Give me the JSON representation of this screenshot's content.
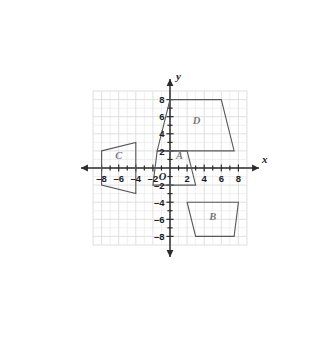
{
  "figure": {
    "background_color": "#ffffff",
    "shape_stroke_color": "#58585c",
    "grid_color": "#e8e8ea",
    "axis_color": "#2b2b2b",
    "label_color": "#7a7a80"
  },
  "axes": {
    "x_axis_name": "x",
    "y_axis_name": "y",
    "origin_label": "O",
    "x_range": [
      -9,
      9
    ],
    "y_range": [
      -9,
      9
    ],
    "grid_step": 1,
    "major_grid_step": 2,
    "x_tick_labels": [
      "–8",
      "–6",
      "–4",
      "–2",
      "2",
      "4",
      "6",
      "8"
    ],
    "x_tick_values": [
      -8,
      -6,
      -4,
      -2,
      2,
      4,
      6,
      8
    ],
    "y_tick_labels": [
      "8",
      "6",
      "4",
      "2",
      "–2",
      "–4",
      "–6",
      "–8"
    ],
    "y_tick_values": [
      8,
      6,
      4,
      2,
      -2,
      -4,
      -6,
      -8
    ]
  },
  "chart_data": {
    "type": "scatter",
    "xlabel": "x",
    "ylabel": "y",
    "xlim": [
      -9,
      9
    ],
    "ylim": [
      -9,
      9
    ],
    "grid": true,
    "legend": "none",
    "series": [
      {
        "name": "A",
        "label": "A",
        "label_position": [
          1.1,
          1.0
        ],
        "vertices": [
          [
            -1.5,
            2
          ],
          [
            2,
            2
          ],
          [
            3,
            -2
          ],
          [
            -2,
            -2
          ]
        ]
      },
      {
        "name": "B",
        "label": "B",
        "label_position": [
          5.0,
          -6.1
        ],
        "vertices": [
          [
            2,
            -4
          ],
          [
            8,
            -4
          ],
          [
            7.5,
            -8
          ],
          [
            3,
            -8
          ]
        ]
      },
      {
        "name": "C",
        "label": "C",
        "label_position": [
          -6.0,
          1.0
        ],
        "vertices": [
          [
            -8,
            2
          ],
          [
            -4,
            3
          ],
          [
            -4,
            -3
          ],
          [
            -8,
            -2
          ]
        ]
      },
      {
        "name": "D",
        "label": "D",
        "label_position": [
          3.1,
          5.1
        ],
        "vertices": [
          [
            0,
            8
          ],
          [
            6,
            8
          ],
          [
            7.5,
            2
          ],
          [
            -1.5,
            2
          ]
        ]
      }
    ]
  }
}
